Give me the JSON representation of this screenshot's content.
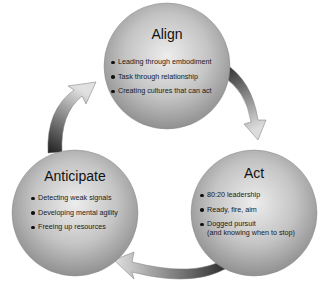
{
  "diagram": {
    "type": "cycle",
    "nodes": [
      {
        "id": "align",
        "title": "Align",
        "items": [
          "Leading through embodiment",
          "Task through relationship",
          "Creating cultures that can act"
        ]
      },
      {
        "id": "act",
        "title": "Act",
        "items": [
          "80:20 leadership",
          "Ready, fire, aim",
          "Dogged pursuit",
          "(and knowing when to stop)"
        ]
      },
      {
        "id": "anticipate",
        "title": "Anticipate",
        "items": [
          "Detecting weak signals",
          "Developing mental agility",
          "Freeing up resources"
        ]
      }
    ],
    "edges": [
      {
        "from": "align",
        "to": "act"
      },
      {
        "from": "act",
        "to": "anticipate"
      },
      {
        "from": "anticipate",
        "to": "align"
      }
    ],
    "colors": {
      "circle_light": "#e8e8e8",
      "circle_dark": "#8a8a8a",
      "arrow_dark": "#1e1e1e",
      "arrow_light": "#d8d8d8"
    }
  }
}
